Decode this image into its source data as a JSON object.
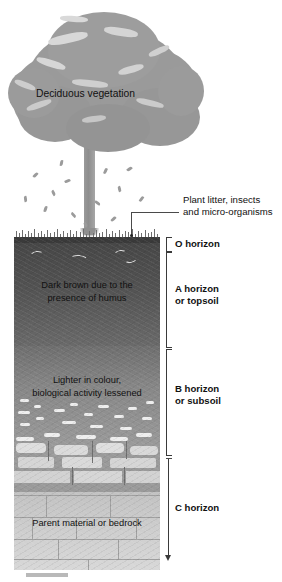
{
  "figure": {
    "type": "soil-horizon-diagram"
  },
  "canopy": {
    "label": "Deciduous vegetation"
  },
  "annotations": {
    "plant_litter": "Plant litter, insects\nand micro-organisms",
    "plant_litter_line1": "Plant litter, insects",
    "plant_litter_line2": "and micro-organisms"
  },
  "horizons": [
    {
      "key": "o",
      "label": "O horizon",
      "bracket_top_px": 237,
      "bracket_height_px": 14,
      "description": "",
      "color": "#3a3a3a"
    },
    {
      "key": "a",
      "label_line1": "A horizon",
      "label_line2": "or topsoil",
      "description_line1": "Dark brown due to the",
      "description_line2": "presence of humus",
      "bracket_top_px": 252,
      "bracket_height_px": 94,
      "color": "#535353"
    },
    {
      "key": "b",
      "label_line1": "B horizon",
      "label_line2": "or subsoil",
      "description_line1": "Lighter in colour,",
      "description_line2": "biological activity lessened",
      "bracket_top_px": 349,
      "bracket_height_px": 105,
      "color": "#878787"
    },
    {
      "key": "c",
      "label": "C horizon",
      "description": "Parent material or bedrock",
      "bracket_top_px": 458,
      "bracket_height_px": 104,
      "color": "#cfcfcf"
    }
  ],
  "colors": {
    "background": "#ffffff",
    "o_horizon": "#3a3a3a",
    "a_horizon": "#535353",
    "b_horizon": "#878787",
    "transition": "#9a9a9a",
    "c_horizon": "#cfcfcf",
    "tree_canopy": "#9a9a9a",
    "trunk": "#8d8d8d",
    "text": "#111111",
    "leader_line": "#3a3a3a"
  },
  "caption": {
    "clipped_text": ""
  }
}
